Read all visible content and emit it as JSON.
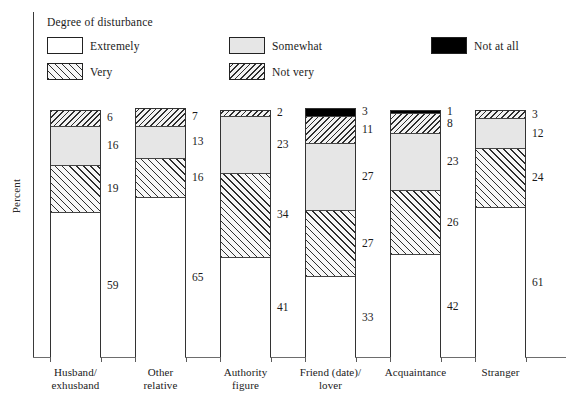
{
  "chart_data": {
    "type": "bar",
    "subtype": "stacked-column-100",
    "title": "",
    "legend_title": "Degree of disturbance",
    "legend_position": "top",
    "xlabel": "",
    "ylabel": "Percent",
    "ylim": [
      0,
      100
    ],
    "grid": false,
    "categories": [
      "Husband/\nexhusband",
      "Other\nrelative",
      "Authority\nfigure",
      "Friend (date)/\nlover",
      "Acquaintance",
      "Stranger"
    ],
    "category_lines": [
      [
        "Husband/",
        "exhusband"
      ],
      [
        "Other",
        "relative"
      ],
      [
        "Authority",
        "figure"
      ],
      [
        "Friend (date)/",
        "lover"
      ],
      [
        "Acquaintance"
      ],
      [
        "Stranger"
      ]
    ],
    "series": [
      {
        "name": "Extremely",
        "pattern": "solid-white",
        "color": "#ffffff",
        "values": [
          59,
          65,
          41,
          33,
          42,
          61
        ]
      },
      {
        "name": "Very",
        "pattern": "hatch-forward",
        "color": "#f7f7f7",
        "values": [
          19,
          16,
          34,
          27,
          26,
          24
        ]
      },
      {
        "name": "Somewhat",
        "pattern": "solid-lightgray",
        "color": "#e6e6e6",
        "values": [
          16,
          13,
          23,
          27,
          23,
          12
        ]
      },
      {
        "name": "Not very",
        "pattern": "hatch-backward",
        "color": "#f2f2f2",
        "values": [
          6,
          7,
          2,
          11,
          8,
          3
        ]
      },
      {
        "name": "Not at all",
        "pattern": "solid-black",
        "color": "#000000",
        "values": [
          0,
          0,
          0,
          3,
          1,
          0
        ]
      }
    ]
  },
  "legend": {
    "title": "Degree of disturbance",
    "items": [
      {
        "label": "Extremely",
        "swatch": "swatch-extremely",
        "col": 0,
        "row": 0
      },
      {
        "label": "Very",
        "swatch": "swatch-very",
        "col": 0,
        "row": 1
      },
      {
        "label": "Somewhat",
        "swatch": "swatch-somewhat",
        "col": 1,
        "row": 0
      },
      {
        "label": "Not very",
        "swatch": "swatch-notvery",
        "col": 1,
        "row": 1
      },
      {
        "label": "Not at all",
        "swatch": "swatch-notatall",
        "col": 2,
        "row": 0
      }
    ]
  },
  "axes": {
    "y_title": "Percent"
  }
}
